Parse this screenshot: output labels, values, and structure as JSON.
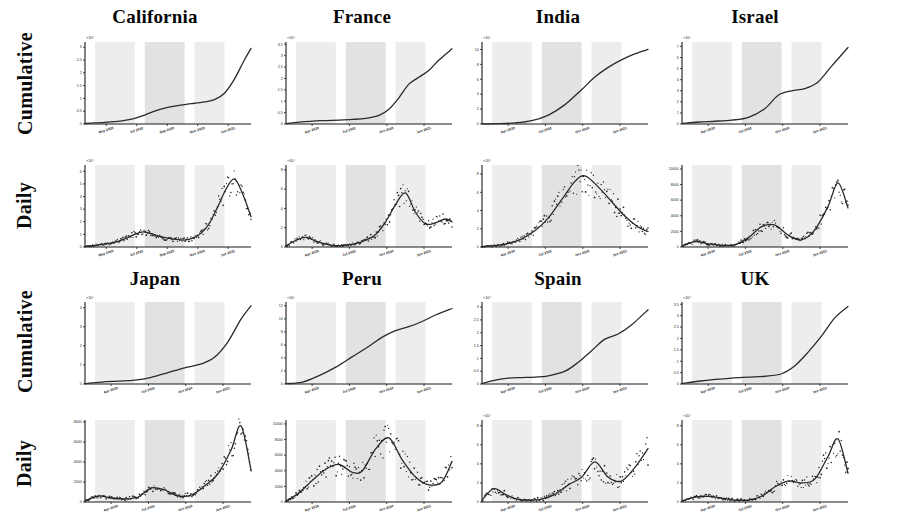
{
  "figure": {
    "title": "",
    "row_labels": [
      "Cumulative",
      "Daily"
    ],
    "x_tick_style": "month-year",
    "background": "#ffffff",
    "curve_color": "#2a2a2a",
    "band_color": "#e2e2e2"
  },
  "chart_data": [
    {
      "id": "california-cumulative",
      "type": "line",
      "title": "California",
      "row": "Cumulative",
      "xlabel": "",
      "ylabel": "",
      "y_exponent": "×10⁶",
      "yticks": [
        0,
        0.5,
        1,
        1.5,
        2,
        2.5,
        3
      ],
      "ytick_labels": [
        "0",
        "0.5",
        "1",
        "1.5",
        "2",
        "2.5",
        "3"
      ],
      "ylim": [
        0,
        3.2
      ],
      "xticks": [
        "May 2020",
        "Jul 2020",
        "Sep 2020",
        "Nov 2020",
        "Jan 2021"
      ],
      "x": [
        0,
        0.06,
        0.12,
        0.18,
        0.24,
        0.3,
        0.36,
        0.42,
        0.48,
        0.54,
        0.6,
        0.66,
        0.72,
        0.78,
        0.84,
        0.9,
        0.96,
        1
      ],
      "values": [
        0.02,
        0.04,
        0.06,
        0.09,
        0.14,
        0.22,
        0.35,
        0.5,
        0.62,
        0.7,
        0.76,
        0.81,
        0.86,
        0.95,
        1.2,
        1.75,
        2.5,
        2.95
      ]
    },
    {
      "id": "california-daily",
      "type": "scatter",
      "title": "California",
      "row": "Daily",
      "y_exponent": "×10⁴",
      "yticks": [
        0,
        1,
        2,
        3,
        4,
        5,
        6
      ],
      "ytick_labels": [
        "0",
        "1",
        "2",
        "3",
        "4",
        "5",
        "6"
      ],
      "ylim": [
        0,
        6.5
      ],
      "xticks": [
        "May 2020",
        "Jul 2020",
        "Sep 2020",
        "Nov 2020",
        "Jan 2021"
      ],
      "x": [
        0,
        0.05,
        0.1,
        0.15,
        0.2,
        0.25,
        0.3,
        0.35,
        0.4,
        0.45,
        0.5,
        0.55,
        0.6,
        0.65,
        0.7,
        0.75,
        0.8,
        0.85,
        0.9,
        0.95,
        1
      ],
      "values": [
        0.05,
        0.1,
        0.2,
        0.3,
        0.45,
        0.7,
        1.0,
        1.2,
        1.05,
        0.85,
        0.7,
        0.6,
        0.55,
        0.7,
        1.1,
        1.9,
        3.2,
        4.6,
        5.4,
        4.2,
        2.4
      ],
      "scatter_spread": 0.55,
      "peak_label": "Jan 2021"
    },
    {
      "id": "france-cumulative",
      "type": "line",
      "title": "France",
      "row": "Cumulative",
      "y_exponent": "×10⁶",
      "yticks": [
        0,
        0.5,
        1,
        1.5,
        2,
        2.5,
        3,
        3.5
      ],
      "ytick_labels": [
        "0",
        "0.5",
        "1",
        "1.5",
        "2",
        "2.5",
        "3",
        "3.5"
      ],
      "ylim": [
        0,
        3.6
      ],
      "xticks": [
        "Apr 2020",
        "Jul 2020",
        "Oct 2020",
        "Jan 2021"
      ],
      "x": [
        0,
        0.08,
        0.16,
        0.24,
        0.32,
        0.4,
        0.48,
        0.56,
        0.62,
        0.68,
        0.74,
        0.8,
        0.86,
        0.92,
        1
      ],
      "values": [
        0.02,
        0.08,
        0.13,
        0.15,
        0.17,
        0.2,
        0.25,
        0.38,
        0.65,
        1.15,
        1.75,
        2.05,
        2.35,
        2.8,
        3.3
      ]
    },
    {
      "id": "france-daily",
      "type": "scatter",
      "title": "France",
      "row": "Daily",
      "y_exponent": "×10⁴",
      "yticks": [
        0,
        2,
        4,
        6,
        8
      ],
      "ytick_labels": [
        "0",
        "2",
        "4",
        "6",
        "8"
      ],
      "ylim": [
        0,
        8.5
      ],
      "xticks": [
        "Apr 2020",
        "Jul 2020",
        "Oct 2020",
        "Jan 2021"
      ],
      "x": [
        0,
        0.06,
        0.12,
        0.18,
        0.24,
        0.3,
        0.36,
        0.42,
        0.48,
        0.54,
        0.6,
        0.66,
        0.72,
        0.78,
        0.84,
        0.9,
        0.96,
        1
      ],
      "values": [
        0.1,
        0.7,
        1.0,
        0.6,
        0.3,
        0.15,
        0.2,
        0.35,
        0.7,
        1.3,
        2.6,
        4.4,
        5.6,
        3.6,
        2.4,
        2.5,
        2.9,
        2.6
      ],
      "scatter_spread": 0.6
    },
    {
      "id": "india-cumulative",
      "type": "line",
      "title": "India",
      "row": "Cumulative",
      "y_exponent": "×10⁷",
      "yticks": [
        0,
        2,
        4,
        6,
        8,
        10
      ],
      "ytick_labels": [
        "0",
        "2",
        "4",
        "6",
        "8",
        "10"
      ],
      "ylim": [
        0,
        11
      ],
      "xticks": [
        "Apr 2020",
        "Jul 2020",
        "Oct 2020",
        "Jan 2021"
      ],
      "x": [
        0,
        0.1,
        0.2,
        0.3,
        0.4,
        0.5,
        0.6,
        0.68,
        0.76,
        0.84,
        0.92,
        1
      ],
      "values": [
        0.02,
        0.05,
        0.15,
        0.45,
        1.2,
        2.6,
        4.6,
        6.3,
        7.6,
        8.6,
        9.4,
        10.0
      ]
    },
    {
      "id": "india-daily",
      "type": "scatter",
      "title": "India",
      "row": "Daily",
      "y_exponent": "×10⁴",
      "yticks": [
        0,
        2,
        4,
        6,
        8
      ],
      "ytick_labels": [
        "0",
        "2",
        "4",
        "6",
        "8"
      ],
      "ylim": [
        0,
        9
      ],
      "xticks": [
        "Apr 2020",
        "Jul 2020",
        "Oct 2020",
        "Jan 2021"
      ],
      "x": [
        0,
        0.08,
        0.16,
        0.24,
        0.32,
        0.4,
        0.48,
        0.56,
        0.62,
        0.7,
        0.78,
        0.86,
        0.94,
        1
      ],
      "values": [
        0.05,
        0.15,
        0.4,
        0.9,
        1.8,
        3.2,
        5.2,
        7.2,
        7.8,
        6.6,
        5.0,
        3.4,
        2.2,
        1.7
      ],
      "scatter_spread": 0.7
    },
    {
      "id": "israel-cumulative",
      "type": "line",
      "title": "Israel",
      "row": "Cumulative",
      "y_exponent": "×10⁵",
      "yticks": [
        0,
        1,
        2,
        3,
        4,
        5,
        6,
        7
      ],
      "ytick_labels": [
        "0",
        "1",
        "2",
        "3",
        "4",
        "5",
        "6",
        "7"
      ],
      "ylim": [
        0,
        7.4
      ],
      "xticks": [
        "Apr 2020",
        "Jul 2020",
        "Oct 2020",
        "Jan 2021"
      ],
      "x": [
        0,
        0.1,
        0.2,
        0.3,
        0.4,
        0.5,
        0.58,
        0.66,
        0.74,
        0.82,
        0.9,
        1
      ],
      "values": [
        0.05,
        0.18,
        0.25,
        0.35,
        0.6,
        1.4,
        2.6,
        3.0,
        3.2,
        3.8,
        5.2,
        6.9
      ]
    },
    {
      "id": "israel-daily",
      "type": "scatter",
      "title": "Israel",
      "row": "Daily",
      "y_exponent": "",
      "yticks": [
        0,
        2000,
        4000,
        6000,
        8000,
        10000
      ],
      "ytick_labels": [
        "0",
        "2000",
        "4000",
        "6000",
        "8000",
        "10000"
      ],
      "ylim": [
        0,
        10500
      ],
      "xticks": [
        "Apr 2020",
        "Jul 2020",
        "Oct 2020",
        "Jan 2021"
      ],
      "x": [
        0,
        0.08,
        0.16,
        0.24,
        0.32,
        0.4,
        0.48,
        0.56,
        0.64,
        0.72,
        0.8,
        0.88,
        0.94,
        1
      ],
      "values": [
        100,
        700,
        400,
        200,
        300,
        1200,
        2600,
        2800,
        1500,
        900,
        2200,
        5200,
        8200,
        5000
      ],
      "scatter_spread": 0.6
    },
    {
      "id": "japan-cumulative",
      "type": "line",
      "title": "Japan",
      "row": "Cumulative",
      "y_exponent": "×10⁵",
      "yticks": [
        0,
        1,
        2,
        3,
        4
      ],
      "ytick_labels": [
        "0",
        "1",
        "2",
        "3",
        "4"
      ],
      "ylim": [
        0,
        4.3
      ],
      "xticks": [
        "Apr 2020",
        "Jul 2020",
        "Oct 2020",
        "Jan 2021"
      ],
      "x": [
        0,
        0.1,
        0.2,
        0.3,
        0.4,
        0.5,
        0.6,
        0.7,
        0.78,
        0.86,
        0.94,
        1
      ],
      "values": [
        0.02,
        0.1,
        0.15,
        0.2,
        0.35,
        0.6,
        0.85,
        1.05,
        1.4,
        2.2,
        3.4,
        4.1
      ]
    },
    {
      "id": "japan-daily",
      "type": "scatter",
      "title": "Japan",
      "row": "Daily",
      "y_exponent": "",
      "yticks": [
        0,
        2000,
        4000,
        6000,
        8000
      ],
      "ytick_labels": [
        "0",
        "2000",
        "4000",
        "6000",
        "8000"
      ],
      "ylim": [
        0,
        8200
      ],
      "xticks": [
        "Apr 2020",
        "Jul 2020",
        "Oct 2020",
        "Jan 2021"
      ],
      "x": [
        0,
        0.08,
        0.16,
        0.24,
        0.32,
        0.4,
        0.48,
        0.56,
        0.64,
        0.72,
        0.8,
        0.88,
        0.94,
        1
      ],
      "values": [
        100,
        600,
        400,
        300,
        500,
        1400,
        1200,
        600,
        700,
        1600,
        2800,
        5200,
        7600,
        3200
      ],
      "scatter_spread": 0.5
    },
    {
      "id": "peru-cumulative",
      "type": "line",
      "title": "Peru",
      "row": "Cumulative",
      "y_exponent": "×10⁵",
      "yticks": [
        0,
        2,
        4,
        6,
        8,
        10,
        12
      ],
      "ytick_labels": [
        "0",
        "2",
        "4",
        "6",
        "8",
        "10",
        "12"
      ],
      "ylim": [
        0,
        12.6
      ],
      "xticks": [
        "Apr 2020",
        "Jul 2020",
        "Oct 2020",
        "Jan 2021"
      ],
      "x": [
        0,
        0.1,
        0.2,
        0.3,
        0.4,
        0.5,
        0.58,
        0.66,
        0.74,
        0.82,
        0.9,
        1
      ],
      "values": [
        0.05,
        0.3,
        1.3,
        2.6,
        4.2,
        5.8,
        7.2,
        8.2,
        8.8,
        9.6,
        10.6,
        11.6
      ]
    },
    {
      "id": "peru-daily",
      "type": "scatter",
      "title": "Peru",
      "row": "Daily",
      "y_exponent": "",
      "yticks": [
        0,
        2000,
        4000,
        6000,
        8000,
        10000
      ],
      "ytick_labels": [
        "0",
        "2000",
        "4000",
        "6000",
        "8000",
        "10000"
      ],
      "ylim": [
        0,
        10500
      ],
      "xticks": [
        "Apr 2020",
        "Jul 2020",
        "Oct 2020",
        "Jan 2021"
      ],
      "x": [
        0,
        0.08,
        0.16,
        0.24,
        0.32,
        0.4,
        0.46,
        0.54,
        0.62,
        0.7,
        0.78,
        0.86,
        0.94,
        1
      ],
      "values": [
        100,
        1200,
        2800,
        4200,
        4800,
        3800,
        4000,
        6800,
        8200,
        5400,
        3200,
        2200,
        2600,
        5200
      ],
      "scatter_spread": 0.8
    },
    {
      "id": "spain-cumulative",
      "type": "line",
      "title": "Spain",
      "row": "Cumulative",
      "y_exponent": "×10⁶",
      "yticks": [
        0,
        0.5,
        1,
        1.5,
        2,
        2.5,
        3
      ],
      "ytick_labels": [
        "0",
        "0.5",
        "1",
        "1.5",
        "2",
        "2.5",
        "3"
      ],
      "ylim": [
        0,
        3.2
      ],
      "xticks": [
        "Apr 2020",
        "Jul 2020",
        "Oct 2020",
        "Jan 2021"
      ],
      "x": [
        0,
        0.08,
        0.16,
        0.24,
        0.32,
        0.4,
        0.5,
        0.58,
        0.66,
        0.74,
        0.82,
        0.9,
        1
      ],
      "values": [
        0.02,
        0.15,
        0.23,
        0.25,
        0.27,
        0.32,
        0.5,
        0.85,
        1.3,
        1.75,
        1.95,
        2.3,
        2.9
      ]
    },
    {
      "id": "spain-daily",
      "type": "scatter",
      "title": "Spain",
      "row": "Daily",
      "y_exponent": "×10⁴",
      "yticks": [
        0,
        2,
        4,
        6,
        8
      ],
      "ytick_labels": [
        "0",
        "2",
        "4",
        "6",
        "8"
      ],
      "ylim": [
        0,
        8.6
      ],
      "xticks": [
        "Apr 2020",
        "Jul 2020",
        "Oct 2020",
        "Jan 2021"
      ],
      "x": [
        0,
        0.07,
        0.14,
        0.21,
        0.28,
        0.36,
        0.44,
        0.52,
        0.6,
        0.68,
        0.76,
        0.84,
        0.92,
        1
      ],
      "values": [
        0.2,
        1.4,
        0.8,
        0.3,
        0.2,
        0.3,
        0.8,
        1.8,
        2.6,
        4.2,
        2.6,
        2.2,
        3.6,
        5.6
      ],
      "scatter_spread": 0.9
    },
    {
      "id": "uk-cumulative",
      "type": "line",
      "title": "UK",
      "row": "Cumulative",
      "y_exponent": "×10⁶",
      "yticks": [
        0,
        0.5,
        1,
        1.5,
        2,
        2.5,
        3,
        3.5
      ],
      "ytick_labels": [
        "0",
        "0.5",
        "1",
        "1.5",
        "2",
        "2.5",
        "3",
        "3.5"
      ],
      "ylim": [
        0,
        3.6
      ],
      "xticks": [
        "Apr 2020",
        "Jul 2020",
        "Oct 2020",
        "Jan 2021"
      ],
      "x": [
        0,
        0.1,
        0.2,
        0.3,
        0.4,
        0.5,
        0.6,
        0.68,
        0.76,
        0.84,
        0.92,
        1
      ],
      "values": [
        0.02,
        0.12,
        0.2,
        0.26,
        0.3,
        0.34,
        0.45,
        0.8,
        1.4,
        2.1,
        2.9,
        3.4
      ]
    },
    {
      "id": "uk-daily",
      "type": "scatter",
      "title": "UK",
      "row": "Daily",
      "y_exponent": "×10⁴",
      "yticks": [
        0,
        2,
        4,
        6,
        8
      ],
      "ytick_labels": [
        "0",
        "2",
        "4",
        "6",
        "8"
      ],
      "ylim": [
        0,
        8.6
      ],
      "xticks": [
        "Apr 2020",
        "Jul 2020",
        "Oct 2020",
        "Jan 2021"
      ],
      "x": [
        0,
        0.08,
        0.16,
        0.24,
        0.32,
        0.4,
        0.48,
        0.56,
        0.64,
        0.72,
        0.8,
        0.88,
        0.94,
        1
      ],
      "values": [
        0.1,
        0.5,
        0.6,
        0.4,
        0.2,
        0.2,
        0.6,
        1.6,
        2.2,
        2.0,
        2.4,
        4.8,
        6.6,
        3.0
      ],
      "scatter_spread": 0.7
    }
  ],
  "panels_top": [
    "california",
    "france",
    "india",
    "israel"
  ],
  "panels_bottom": [
    "japan",
    "peru",
    "spain",
    "uk"
  ]
}
